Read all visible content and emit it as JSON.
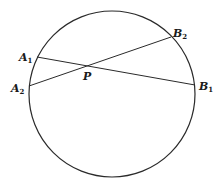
{
  "diagram": {
    "type": "intersecting-chords",
    "circle": {
      "cx": 112,
      "cy": 94,
      "r": 83,
      "stroke": "#2a2a2a"
    },
    "points": {
      "A1": {
        "x": 37,
        "y": 57
      },
      "A2": {
        "x": 29,
        "y": 86
      },
      "B1": {
        "x": 195,
        "y": 85
      },
      "B2": {
        "x": 171,
        "y": 37
      },
      "P": {
        "x": 87,
        "y": 66
      }
    },
    "chords": [
      {
        "from": "A1",
        "to": "B1"
      },
      {
        "from": "A2",
        "to": "B2"
      }
    ],
    "labels": {
      "A1": {
        "main": "A",
        "sub": "1"
      },
      "A2": {
        "main": "A",
        "sub": "2"
      },
      "B1": {
        "main": "B",
        "sub": "1"
      },
      "B2": {
        "main": "B",
        "sub": "2"
      },
      "P": {
        "main": "P"
      }
    }
  }
}
